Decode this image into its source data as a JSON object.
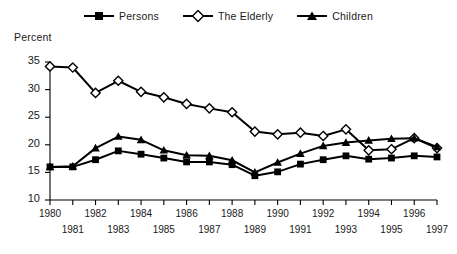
{
  "chart_data": {
    "type": "line",
    "title": "",
    "ylabel": "Percent",
    "xlabel": "",
    "ylim": [
      10,
      35
    ],
    "yticks": [
      10,
      15,
      20,
      25,
      30,
      35
    ],
    "grid": false,
    "legend_position": "top-center",
    "x": [
      1980,
      1981,
      1982,
      1983,
      1984,
      1985,
      1986,
      1987,
      1988,
      1989,
      1990,
      1991,
      1992,
      1993,
      1994,
      1995,
      1996,
      1997
    ],
    "xticks": [
      "1980",
      "1981",
      "1982",
      "1983",
      "1984",
      "1985",
      "1986",
      "1987",
      "1988",
      "1989",
      "1990",
      "1991",
      "1992",
      "1993",
      "1994",
      "1995",
      "1996",
      "1997"
    ],
    "series": [
      {
        "name": "Persons",
        "marker": "filled-square",
        "color": "#000000",
        "values": [
          16.0,
          16.0,
          17.3,
          18.9,
          18.3,
          17.6,
          16.9,
          16.9,
          16.4,
          14.4,
          15.1,
          16.5,
          17.3,
          18.0,
          17.4,
          17.6,
          18.0,
          17.8
        ]
      },
      {
        "name": "The Elderly",
        "marker": "open-diamond",
        "color": "#000000",
        "values": [
          34.2,
          34.0,
          29.4,
          31.6,
          29.6,
          28.6,
          27.4,
          26.6,
          25.9,
          22.4,
          21.9,
          22.2,
          21.6,
          22.8,
          19.0,
          19.2,
          21.2,
          19.4
        ]
      },
      {
        "name": "Children",
        "marker": "filled-triangle",
        "color": "#000000",
        "values": [
          16.0,
          16.1,
          19.4,
          21.5,
          20.9,
          19.0,
          18.1,
          18.0,
          17.2,
          15.0,
          16.8,
          18.4,
          19.8,
          20.4,
          20.8,
          21.1,
          21.2,
          19.6
        ]
      }
    ]
  },
  "legend": {
    "items": [
      {
        "label": "Persons",
        "marker": "filled-square"
      },
      {
        "label": "The Elderly",
        "marker": "open-diamond"
      },
      {
        "label": "Children",
        "marker": "filled-triangle"
      }
    ]
  }
}
